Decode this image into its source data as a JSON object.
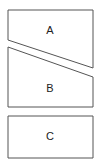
{
  "diagram": {
    "shapes": [
      {
        "id": "A",
        "label": "A",
        "points": "8,10 93,10 93,68 8,40",
        "label_x": 50,
        "label_y": 31
      },
      {
        "id": "B",
        "label": "B",
        "points": "8,47 93,77 93,107 8,107",
        "label_x": 50,
        "label_y": 89
      },
      {
        "id": "C",
        "label": "C",
        "points": "8,116 93,116 93,158 8,158",
        "label_x": 50,
        "label_y": 137
      }
    ],
    "stroke_color": "#555555",
    "fill_color": "#ffffff"
  }
}
